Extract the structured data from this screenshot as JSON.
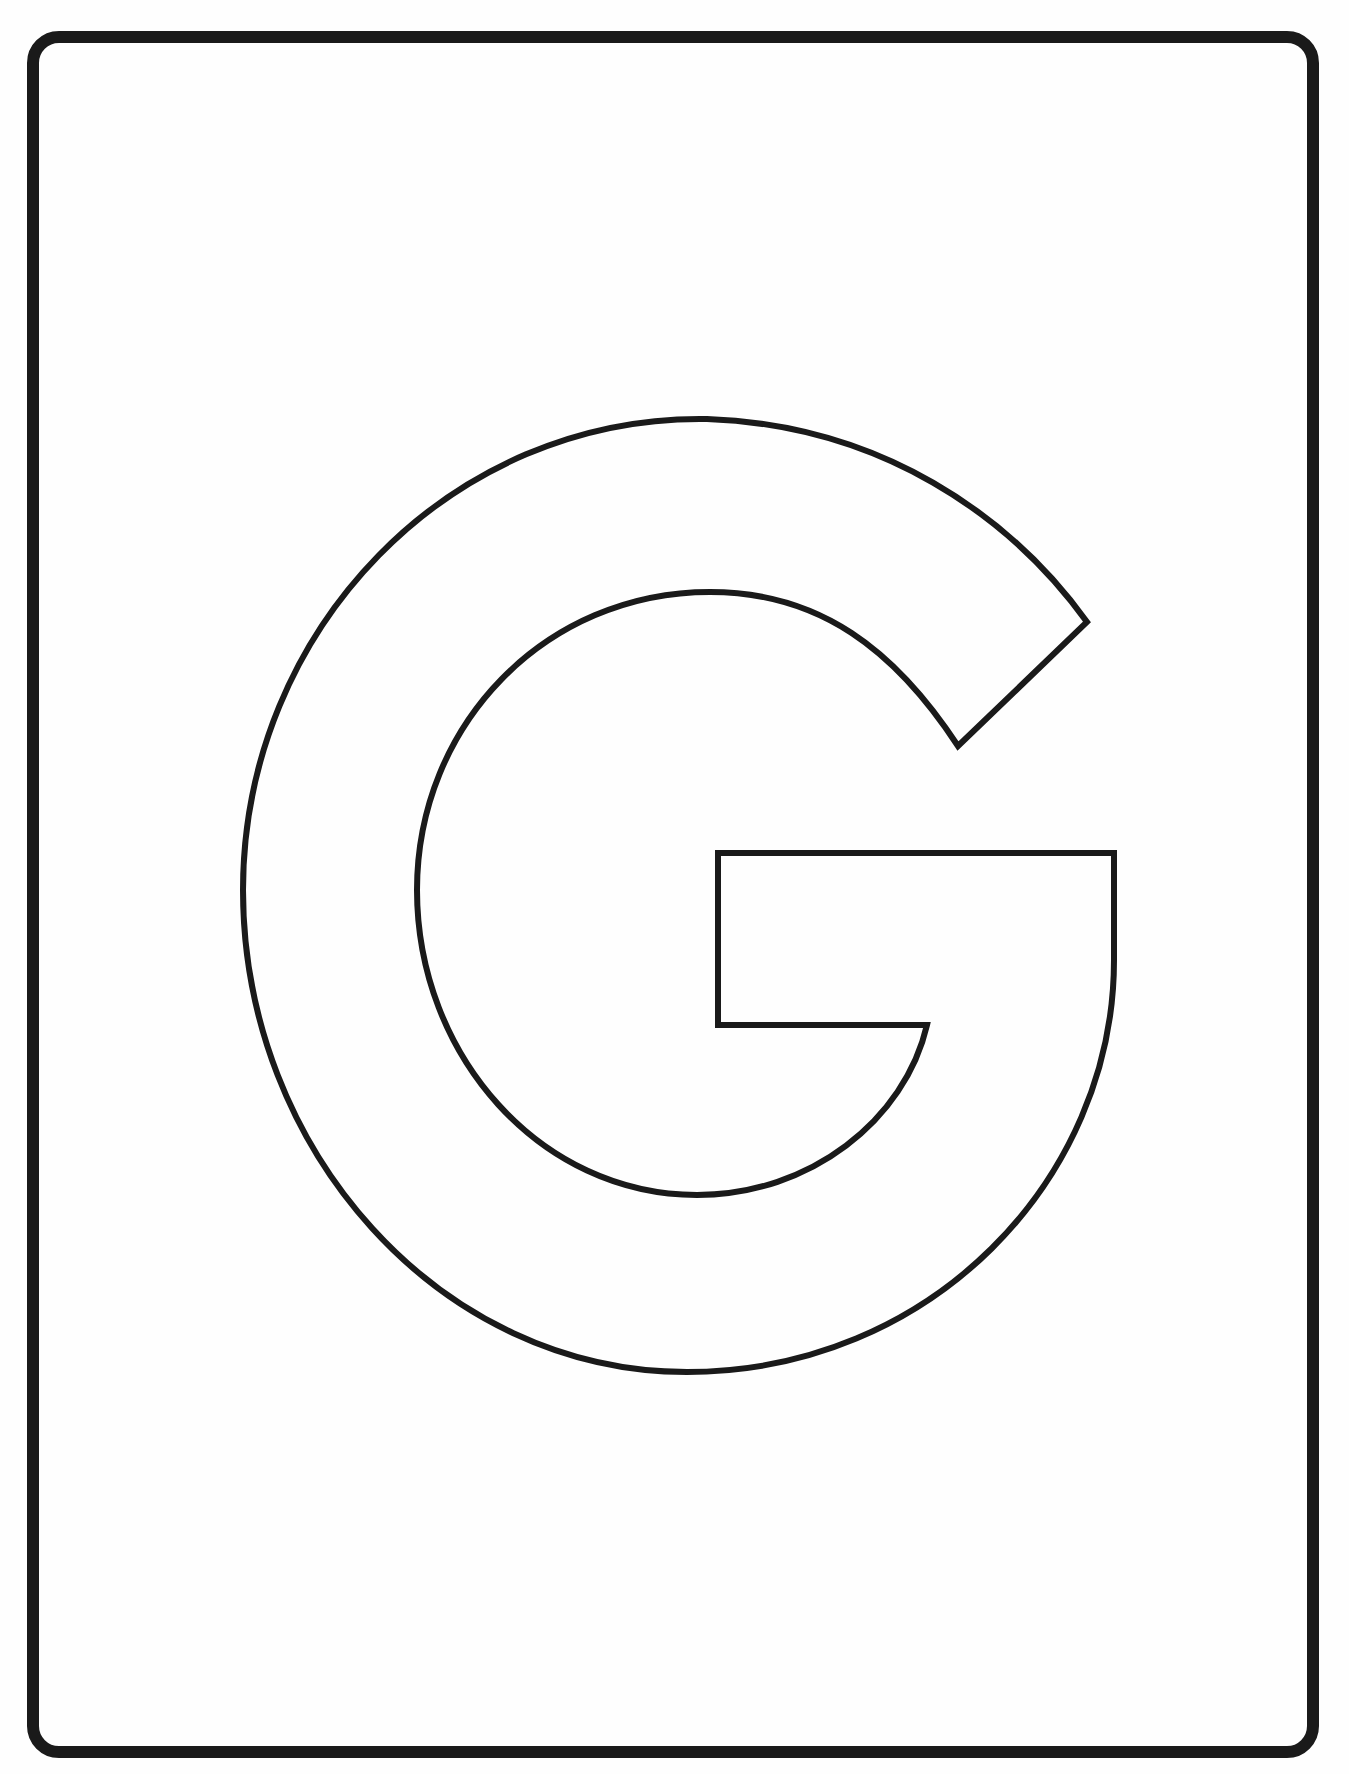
{
  "page": {
    "type": "coloring-page",
    "letter": "G",
    "background_color": "#ffffff",
    "outline_color": "#1a1a1a",
    "frame": {
      "shape": "rounded-rectangle",
      "stroke_width": 12,
      "corner_radius": 32
    },
    "letter_outline": {
      "stroke_width": 6,
      "fill": "none"
    }
  }
}
